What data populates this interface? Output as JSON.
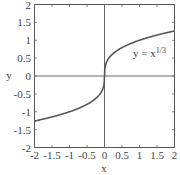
{
  "chart_data": {
    "type": "line",
    "title": "",
    "xlabel": "x",
    "ylabel": "y",
    "xlim": [
      -2,
      2
    ],
    "ylim": [
      -2,
      2
    ],
    "xticks": [
      -2,
      -1.5,
      -1,
      -0.5,
      0,
      0.5,
      1,
      1.5,
      2
    ],
    "yticks": [
      -2,
      -1.5,
      -1,
      -0.5,
      0,
      0.5,
      1,
      1.5,
      2
    ],
    "xtick_labels": [
      "-2",
      "-1.5",
      "-1",
      "-0.5",
      "0",
      "0.5",
      "1",
      "1.5",
      "2"
    ],
    "ytick_labels": [
      "-2",
      "-1.5",
      "-1",
      "-0.5",
      "0",
      "0.5",
      "1",
      "1.5",
      "2"
    ],
    "grid": false,
    "axes_lines_at_zero": true,
    "series": [
      {
        "name": "y = x^(1/3)",
        "function": "cbrt(x)",
        "x": [
          -2,
          -1.5,
          -1,
          -0.5,
          -0.125,
          0,
          0.125,
          0.5,
          1,
          1.5,
          2
        ],
        "y": [
          -1.26,
          -1.145,
          -1.0,
          -0.794,
          -0.5,
          0,
          0.5,
          0.794,
          1.0,
          1.145,
          1.26
        ],
        "color": "#555555"
      }
    ],
    "annotations": [
      {
        "text": "y = x",
        "superscript": "1/3",
        "x": 1.0,
        "y": 0.85
      }
    ]
  },
  "labels": {
    "xlabel": "x",
    "ylabel": "y",
    "curve_label_base": "y = x",
    "curve_label_sup": "1/3"
  }
}
